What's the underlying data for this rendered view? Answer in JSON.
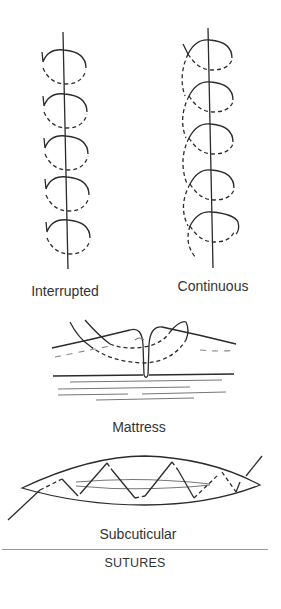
{
  "figure": {
    "title": "SUTURES",
    "panels": [
      {
        "id": "interrupted",
        "label": "Interrupted"
      },
      {
        "id": "continuous",
        "label": "Continuous"
      },
      {
        "id": "mattress",
        "label": "Mattress"
      },
      {
        "id": "subcuticular",
        "label": "Subcuticular"
      }
    ]
  }
}
